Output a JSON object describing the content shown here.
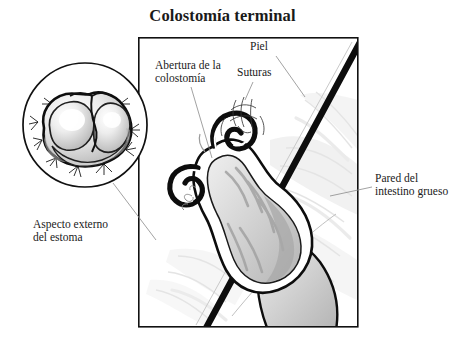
{
  "figure": {
    "title": "Colostomía terminal",
    "type": "medical-anatomical-illustration",
    "language": "es",
    "background_color": "#ffffff",
    "ink_color": "#0d0d0d"
  },
  "labels": {
    "abertura": "Abertura de la\ncolostomía",
    "suturas": "Suturas",
    "piel": "Piel",
    "aspecto": "Aspecto externo\ndel estoma",
    "pared": "Pared del\nintestino grueso"
  },
  "panels": {
    "main_frame": {
      "name": "main-illustration-frame",
      "x": 138,
      "y": 37,
      "width": 220,
      "height": 290
    },
    "inset_circle": {
      "name": "stoma-external-view-inset",
      "center_x": 85,
      "center_y": 125,
      "radius": 62
    }
  },
  "structures": [
    {
      "id": "skin",
      "label": "Piel",
      "tone": "#0d0d0d"
    },
    {
      "id": "sutures",
      "label": "Suturas",
      "tone": "#3a3a3a"
    },
    {
      "id": "colostomy-opening",
      "label": "Abertura de la colostomía",
      "tone": "#9a9a9a"
    },
    {
      "id": "large-bowel-wall",
      "label": "Pared del intestino grueso",
      "tone": "#b8b8b8"
    },
    {
      "id": "stoma-external",
      "label": "Aspecto externo del estoma",
      "tone": "#d0d0d0"
    }
  ],
  "palette": {
    "tissue_light": "#f0f0f0",
    "tissue_mid": "#d8d8d8",
    "tissue_dark": "#b0b0b0",
    "highlight": "#fbfbfb",
    "outline": "#0d0d0d"
  }
}
